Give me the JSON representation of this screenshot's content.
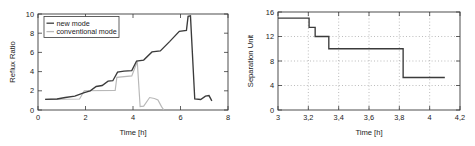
{
  "figure": {
    "background_color": "#ffffff",
    "panel_count": 2
  },
  "chart_data": [
    {
      "type": "line",
      "id": "reflux-ratio-chart",
      "title": "",
      "xlabel": "Time [h]",
      "ylabel": "Reflux Ratio",
      "xlim": [
        0,
        8
      ],
      "ylim": [
        0,
        10
      ],
      "xticks": [
        0,
        2,
        4,
        6,
        8
      ],
      "xticklabels": [
        "0",
        "2",
        "4",
        "6",
        "8"
      ],
      "yticks": [
        0,
        2,
        4,
        6,
        8,
        10
      ],
      "yticklabels": [
        "0",
        "2",
        "4",
        "6",
        "8",
        "10"
      ],
      "grid": false,
      "legend_position": "upper left",
      "legend_entries": [
        "new mode",
        "conventional mode"
      ],
      "series": [
        {
          "name": "new mode",
          "color": "#3b3b3b",
          "style": "solid",
          "x": [
            0.3,
            0.8,
            0.8,
            1.15,
            1.15,
            1.55,
            1.55,
            1.95,
            1.95,
            2.2,
            2.2,
            2.45,
            2.45,
            2.7,
            2.7,
            2.95,
            2.95,
            3.15,
            3.15,
            3.35,
            3.35,
            3.62,
            3.62,
            3.95,
            3.95,
            4.15,
            4.15,
            4.45,
            4.45,
            4.8,
            4.8,
            5.15,
            5.15,
            5.55,
            5.55,
            5.95,
            5.95,
            6.25,
            6.25,
            6.32,
            6.32,
            6.42,
            6.42,
            6.6,
            6.6,
            6.85,
            6.85,
            7.05,
            7.05,
            7.2,
            7.2,
            7.32
          ],
          "y": [
            1.1,
            1.15,
            1.15,
            1.3,
            1.3,
            1.45,
            1.45,
            1.8,
            1.8,
            2.0,
            2.0,
            2.45,
            2.45,
            2.55,
            2.55,
            3.0,
            3.0,
            3.05,
            3.05,
            3.95,
            3.95,
            4.05,
            4.05,
            4.1,
            4.1,
            5.1,
            5.1,
            5.2,
            5.2,
            6.05,
            6.05,
            6.15,
            6.15,
            7.15,
            7.15,
            8.2,
            8.2,
            8.3,
            8.3,
            9.75,
            9.75,
            9.8,
            9.8,
            1.15,
            1.15,
            1.1,
            1.1,
            1.45,
            1.45,
            1.5,
            1.5,
            0.95
          ]
        },
        {
          "name": "conventional mode",
          "color": "#b8b8b8",
          "style": "solid",
          "x": [
            0.3,
            1.75,
            1.75,
            1.95,
            1.95,
            3.25,
            3.25,
            3.32,
            3.32,
            3.95,
            3.95,
            4.18,
            4.18,
            4.3,
            4.3,
            4.45,
            4.45,
            4.7,
            4.7,
            4.9,
            4.9,
            5.05,
            5.05,
            5.2,
            5.2,
            5.3
          ],
          "y": [
            1.1,
            1.15,
            1.15,
            2.0,
            2.0,
            2.05,
            2.05,
            3.4,
            3.4,
            3.55,
            3.55,
            5.05,
            5.05,
            0.35,
            0.35,
            0.4,
            0.4,
            1.3,
            1.3,
            1.2,
            1.2,
            1.05,
            1.05,
            0.35,
            0.35,
            0.0
          ]
        }
      ]
    },
    {
      "type": "line",
      "id": "separation-unit-chart",
      "title": "",
      "xlabel": "Time [h]",
      "ylabel": "Separation Unit",
      "xlim": [
        3,
        4.2
      ],
      "ylim": [
        0,
        16
      ],
      "xticks": [
        3,
        3.2,
        3.4,
        3.6,
        3.8,
        4,
        4.2
      ],
      "xticklabels": [
        "3",
        "3,2",
        "3,4",
        "3,6",
        "3,8",
        "4",
        "4,2"
      ],
      "yticks": [
        0,
        4,
        8,
        12,
        16
      ],
      "yticklabels": [
        "0",
        "4",
        "8",
        "12",
        "16"
      ],
      "grid": true,
      "grid_style": "dotted",
      "legend_position": "none",
      "series": [
        {
          "name": "separation unit",
          "color": "#3b3b3b",
          "style": "solid",
          "step": true,
          "x": [
            3.0,
            3.205,
            3.205,
            3.245,
            3.245,
            3.335,
            3.335,
            3.825,
            3.825,
            4.1
          ],
          "y": [
            15.0,
            15.0,
            13.5,
            13.5,
            12.0,
            12.0,
            10.0,
            10.0,
            5.3,
            5.3
          ]
        }
      ]
    }
  ]
}
